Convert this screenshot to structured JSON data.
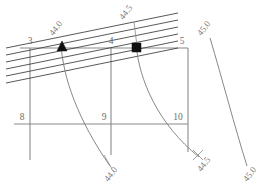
{
  "figure": {
    "type": "contour-grid-diagram",
    "width": 277,
    "height": 191,
    "background": "#ffffff",
    "line_color": "#8a8a8a",
    "hatch_color": "#3a3a3a",
    "contour_color": "#7a7a7a",
    "marker_color": "#111111"
  },
  "grid_nodes": [
    {
      "id": "n3",
      "label": "3",
      "x": 30,
      "y": 44
    },
    {
      "id": "n4",
      "label": "4",
      "x": 111,
      "y": 44
    },
    {
      "id": "n5",
      "label": "5",
      "x": 182,
      "y": 44
    },
    {
      "id": "n8",
      "label": "8",
      "x": 22,
      "y": 117
    },
    {
      "id": "n9",
      "label": "9",
      "x": 104,
      "y": 117
    },
    {
      "id": "n10",
      "label": "10",
      "x": 176,
      "y": 117
    }
  ],
  "contour_labels": [
    {
      "id": "c44-top",
      "text": "44.0",
      "x": 58,
      "y": 30,
      "rotation": -52
    },
    {
      "id": "c445-top",
      "text": "44.5",
      "x": 128,
      "y": 14,
      "rotation": -52
    },
    {
      "id": "c45-top",
      "text": "45.0",
      "x": 206,
      "y": 30,
      "rotation": -52
    },
    {
      "id": "c44-bottom",
      "text": "44.0",
      "x": 113,
      "y": 176,
      "rotation": -52
    },
    {
      "id": "c445-bottom",
      "text": "44.5",
      "x": 203,
      "y": 163,
      "rotation": -52
    },
    {
      "id": "c45-bottom",
      "text": "45.0",
      "x": 250,
      "y": 174,
      "rotation": -52
    }
  ],
  "markers": [
    {
      "id": "triangle-marker",
      "shape": "triangle",
      "x": 62,
      "y": 48,
      "contour": "44.0"
    },
    {
      "id": "square-marker",
      "shape": "square",
      "x": 137,
      "y": 48,
      "contour": "44.5"
    }
  ],
  "contour_lines": [
    {
      "id": "contour-44-0",
      "value": "44.0"
    },
    {
      "id": "contour-44-5",
      "value": "44.5"
    },
    {
      "id": "contour-45-0",
      "value": "45.0"
    }
  ],
  "hatch_band": {
    "line_count": 6,
    "description": "parallel diagonal hatch lines across upper band"
  }
}
